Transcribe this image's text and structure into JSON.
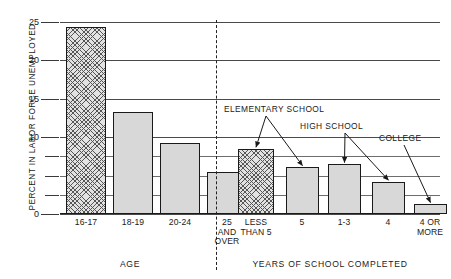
{
  "chart_data": {
    "type": "bar",
    "title": "",
    "subtitle": "",
    "xlabel": "",
    "ylabel": "PERCENT IN LABOR FORCE UNEMPLOYED",
    "ylim": [
      0,
      25
    ],
    "grid": true,
    "legend_position": "none",
    "y_major_ticks": [
      0,
      10,
      15,
      20,
      25
    ],
    "y_tick_labels": [
      "0",
      "10",
      "15",
      "20",
      "25"
    ],
    "y_minor_ticks": [
      2.5,
      5,
      7.5
    ],
    "panels": [
      {
        "name": "AGE",
        "axis_caption": "AGE",
        "categories": [
          "16-17",
          "18-19",
          "20-24",
          "25\nAND\nOVER"
        ],
        "values": [
          24.3,
          13.3,
          9.2,
          5.5
        ],
        "fills": [
          "hatched",
          "solid",
          "solid",
          "solid"
        ]
      },
      {
        "name": "YEARS OF SCHOOL COMPLETED",
        "axis_caption": "YEARS OF SCHOOL COMPLETED",
        "categories": [
          "LESS\nTHAN 5",
          "5",
          "1-3",
          "4",
          "4 OR\nMORE"
        ],
        "values": [
          8.5,
          6.1,
          6.5,
          4.2,
          1.3
        ],
        "fills": [
          "hatched",
          "solid",
          "solid",
          "solid",
          "solid"
        ]
      }
    ],
    "annotations": [
      {
        "text": "ELEMENTARY SCHOOL",
        "targets": [
          "LESS THAN 5",
          "5"
        ]
      },
      {
        "text": "HIGH SCHOOL",
        "targets": [
          "1-3",
          "4"
        ]
      },
      {
        "text": "COLLEGE",
        "targets": [
          "4 OR MORE"
        ]
      }
    ],
    "colors": {
      "bar_solid": "#d8d8d8",
      "bar_hatch": "#e2e2e2",
      "outline": "#1a1a1a",
      "grid": "#4a4a4a",
      "text": "#1a1a1a"
    }
  }
}
